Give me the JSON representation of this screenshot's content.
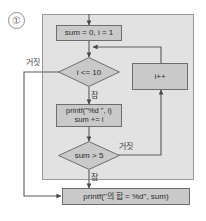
{
  "marker": {
    "label": "①"
  },
  "panel": {
    "name": "flowchart-panel"
  },
  "nodes": {
    "init": {
      "text": "sum = 0, i = 1"
    },
    "cond_loop": {
      "text": "i <= 10"
    },
    "body": {
      "text": "printf(\"%d \", i)\nsum += i"
    },
    "cond_break": {
      "text": "sum > 5"
    },
    "increment": {
      "text": "i++"
    },
    "output": {
      "text": "printf(\"의 합 = %d\", sum)"
    }
  },
  "edge_labels": {
    "loop_false": "거짓",
    "loop_true": "참",
    "break_false": "거짓",
    "break_true": "참"
  },
  "colors": {
    "panel_fill": "#e2e2e2",
    "panel_border": "#9a9a9a",
    "node_fill": "#c9c9c9",
    "node_border": "#6d6d6d",
    "wire": "#5a5a5a",
    "text": "#2b2b2b"
  }
}
